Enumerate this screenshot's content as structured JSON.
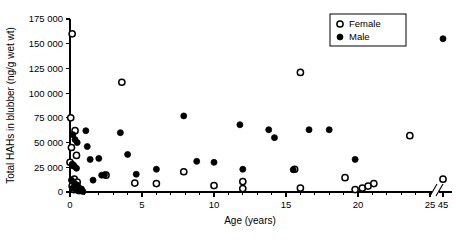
{
  "chart_data": {
    "type": "scatter",
    "title": "",
    "xlabel": "Age (years)",
    "ylabel": "Total HAHs in blubber (ng/g wet wt)",
    "xlim": [
      0,
      25
    ],
    "ylim": [
      0,
      175000
    ],
    "grid": false,
    "axis_break": {
      "present": true,
      "after": 25,
      "resumes_at": 45,
      "label_left": "25",
      "label_right": "45"
    },
    "xticks_major": [
      0,
      5,
      10,
      15,
      20,
      25,
      45
    ],
    "xticklabels": [
      "0",
      "5",
      "10",
      "15",
      "20",
      "25",
      "45"
    ],
    "xticks_minor_step": 1,
    "yticks": [
      0,
      25000,
      50000,
      75000,
      100000,
      125000,
      150000,
      175000
    ],
    "yticklabels": [
      "0",
      "25 000",
      "50 000",
      "75 000",
      "100 000",
      "125 000",
      "150 000",
      "175 000"
    ],
    "legend": {
      "position": "top-right",
      "entries": [
        {
          "name": "Female",
          "marker": "open-circle"
        },
        {
          "name": "Male",
          "marker": "filled-circle"
        }
      ]
    },
    "series": [
      {
        "name": "Female",
        "marker": "open-circle",
        "points": [
          {
            "x": 0.15,
            "y": 160000
          },
          {
            "x": 0.05,
            "y": 75000
          },
          {
            "x": 0.35,
            "y": 62000
          },
          {
            "x": 0.1,
            "y": 45000
          },
          {
            "x": 0.45,
            "y": 37000
          },
          {
            "x": 0.0,
            "y": 30000
          },
          {
            "x": 0.2,
            "y": 27000
          },
          {
            "x": 0.3,
            "y": 13000
          },
          {
            "x": 0.5,
            "y": 10000
          },
          {
            "x": 0.15,
            "y": 6000
          },
          {
            "x": 0.55,
            "y": 4500
          },
          {
            "x": 0.25,
            "y": 2500
          },
          {
            "x": 0.7,
            "y": 1500
          },
          {
            "x": 3.6,
            "y": 111000
          },
          {
            "x": 2.5,
            "y": 17000
          },
          {
            "x": 4.5,
            "y": 9000
          },
          {
            "x": 6.0,
            "y": 8500
          },
          {
            "x": 7.9,
            "y": 20500
          },
          {
            "x": 10.0,
            "y": 6500
          },
          {
            "x": 12.0,
            "y": 10500
          },
          {
            "x": 12.0,
            "y": 3500
          },
          {
            "x": 15.6,
            "y": 23000
          },
          {
            "x": 16.0,
            "y": 121000
          },
          {
            "x": 16.0,
            "y": 4000
          },
          {
            "x": 19.1,
            "y": 14500
          },
          {
            "x": 19.8,
            "y": 2500
          },
          {
            "x": 20.3,
            "y": 4000
          },
          {
            "x": 20.7,
            "y": 6000
          },
          {
            "x": 21.1,
            "y": 8500
          },
          {
            "x": 23.6,
            "y": 57000
          },
          {
            "x": 45.0,
            "y": 13000
          }
        ]
      },
      {
        "name": "Male",
        "marker": "filled-circle",
        "points": [
          {
            "x": 0.2,
            "y": 58000
          },
          {
            "x": 0.35,
            "y": 53000
          },
          {
            "x": 0.5,
            "y": 50000
          },
          {
            "x": 0.15,
            "y": 28000
          },
          {
            "x": 0.3,
            "y": 26000
          },
          {
            "x": 0.45,
            "y": 24000
          },
          {
            "x": 0.1,
            "y": 12000
          },
          {
            "x": 0.3,
            "y": 9000
          },
          {
            "x": 0.5,
            "y": 7000
          },
          {
            "x": 0.2,
            "y": 4000
          },
          {
            "x": 0.4,
            "y": 2000
          },
          {
            "x": 0.6,
            "y": 1000
          },
          {
            "x": 0.8,
            "y": 3000
          },
          {
            "x": 0.9,
            "y": 500
          },
          {
            "x": 1.1,
            "y": 62000
          },
          {
            "x": 1.2,
            "y": 46000
          },
          {
            "x": 1.4,
            "y": 33000
          },
          {
            "x": 1.6,
            "y": 12000
          },
          {
            "x": 2.0,
            "y": 34000
          },
          {
            "x": 2.2,
            "y": 17000
          },
          {
            "x": 2.4,
            "y": 17500
          },
          {
            "x": 3.5,
            "y": 60000
          },
          {
            "x": 4.0,
            "y": 38000
          },
          {
            "x": 4.6,
            "y": 18000
          },
          {
            "x": 6.0,
            "y": 23000
          },
          {
            "x": 7.9,
            "y": 77000
          },
          {
            "x": 8.8,
            "y": 31000
          },
          {
            "x": 10.0,
            "y": 30000
          },
          {
            "x": 11.8,
            "y": 68000
          },
          {
            "x": 12.0,
            "y": 23000
          },
          {
            "x": 13.8,
            "y": 63000
          },
          {
            "x": 14.2,
            "y": 55000
          },
          {
            "x": 15.5,
            "y": 22500
          },
          {
            "x": 16.6,
            "y": 63000
          },
          {
            "x": 18.0,
            "y": 63000
          },
          {
            "x": 19.8,
            "y": 33000
          },
          {
            "x": 45.0,
            "y": 155000
          }
        ]
      }
    ]
  }
}
